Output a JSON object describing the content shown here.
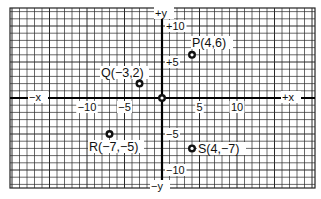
{
  "figure": {
    "axis_labels": {
      "x_positive": "+x",
      "x_negative": "−x",
      "y_positive": "+y",
      "y_negative": "−y"
    },
    "x_ticks": [
      {
        "value": -10,
        "label": "−10"
      },
      {
        "value": -5,
        "label": "−5"
      },
      {
        "value": 5,
        "label": "5"
      },
      {
        "value": 10,
        "label": "10"
      }
    ],
    "y_ticks": [
      {
        "value": 10,
        "label": "+10"
      },
      {
        "value": 5,
        "label": "+5"
      },
      {
        "value": -5,
        "label": "−5"
      },
      {
        "value": -10,
        "label": "−10"
      }
    ],
    "points": [
      {
        "name": "P",
        "x": 4,
        "y": 6,
        "label": "P(4,6)"
      },
      {
        "name": "Q",
        "x": -3,
        "y": 2,
        "label": "Q(−3,2)"
      },
      {
        "name": "R",
        "x": -7,
        "y": -5,
        "label": "R(−7,−5)"
      },
      {
        "name": "S",
        "x": 4,
        "y": -7,
        "label": "S(4,−7)"
      },
      {
        "name": "O",
        "x": 0,
        "y": 0,
        "label": ""
      }
    ],
    "colors": {
      "grid": "#2a2a2a",
      "axis": "#000000",
      "background": "#ffffff"
    }
  },
  "chart_data": {
    "type": "scatter",
    "title": "",
    "xlabel": "x",
    "ylabel": "y",
    "xlim": [
      -20,
      20
    ],
    "ylim": [
      -12,
      12
    ],
    "grid": true,
    "x_tick_labels": [
      "-10",
      "-5",
      "5",
      "10"
    ],
    "y_tick_labels": [
      "+10",
      "+5",
      "-5",
      "-10"
    ],
    "series": [
      {
        "name": "points",
        "points": [
          {
            "label": "P",
            "x": 4,
            "y": 6
          },
          {
            "label": "Q",
            "x": -3,
            "y": 2
          },
          {
            "label": "R",
            "x": -7,
            "y": -5
          },
          {
            "label": "S",
            "x": 4,
            "y": -7
          },
          {
            "label": "origin",
            "x": 0,
            "y": 0
          }
        ]
      }
    ],
    "annotations": [
      "P(4,6)",
      "Q(-3,2)",
      "R(-7,-5)",
      "S(4,-7)",
      "+x",
      "-x",
      "+y",
      "-y"
    ]
  }
}
